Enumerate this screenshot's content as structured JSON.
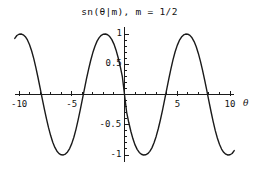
{
  "chart_data": {
    "type": "line",
    "title": "sn(θ|m), m = 1/2",
    "title_parts": {
      "func": "sn(",
      "theta": "θ",
      "bar": "|",
      "m1": "m",
      "close": "),",
      "m2": "m",
      "eq": "=",
      "value": "1/2"
    },
    "xlabel": "θ",
    "ylabel": "",
    "xlim": [
      -10.4,
      10.4
    ],
    "ylim": [
      -1.12,
      1.12
    ],
    "grid": false,
    "legend": null,
    "x_major_ticks": [
      -10,
      -5,
      5,
      10
    ],
    "x_major_tick_labels": [
      "-10",
      "-5",
      "5",
      "10"
    ],
    "x_minor_ticks": [
      -9,
      -8,
      -7,
      -6,
      -4,
      -3,
      -2,
      -1,
      1,
      2,
      3,
      4,
      6,
      7,
      8,
      9
    ],
    "y_major_ticks": [
      -1,
      -0.5,
      0.5,
      1
    ],
    "y_major_tick_labels": [
      "-1",
      "-0.5",
      "0.5",
      "1"
    ],
    "y_minor_ticks": [
      -0.9,
      -0.8,
      -0.7,
      -0.6,
      -0.4,
      -0.3,
      -0.2,
      -0.1,
      0.1,
      0.2,
      0.3,
      0.4,
      0.6,
      0.7,
      0.8,
      0.9
    ],
    "series": [
      {
        "name": "sn(θ|1/2)",
        "color": "#1a1a1a",
        "parameter_m": 0.5,
        "quarter_period_K": 1.8541,
        "period": 7.4163,
        "zeros": [
          -7.4163,
          -3.7081,
          0,
          3.7081,
          7.4163
        ],
        "maxima_x": [
          -9.2704,
          -1.8541,
          5.5622
        ],
        "minima_x": [
          -5.5622,
          1.8541,
          9.2704
        ],
        "x": [
          -10.4,
          -10.2,
          -10,
          -9.8,
          -9.6,
          -9.4,
          -9.2,
          -9,
          -8.8,
          -8.6,
          -8.4,
          -8.2,
          -8,
          -7.8,
          -7.6,
          -7.4,
          -7.2,
          -7,
          -6.8,
          -6.6,
          -6.4,
          -6.2,
          -6,
          -5.8,
          -5.6,
          -5.4,
          -5.2,
          -5,
          -4.8,
          -4.6,
          -4.4,
          -4.2,
          -4,
          -3.8,
          -3.6,
          -3.4,
          -3.2,
          -3,
          -2.8,
          -2.6,
          -2.4,
          -2.2,
          -2,
          -1.8,
          -1.6,
          -1.4,
          -1.2,
          -1,
          -0.8,
          -0.6,
          -0.4,
          -0.2,
          0,
          0.2,
          0.4,
          0.6,
          0.8,
          1,
          1.2,
          1.4,
          1.6,
          1.8,
          2,
          2.2,
          2.4,
          2.6,
          2.8,
          3,
          3.2,
          3.4,
          3.6,
          3.8,
          4,
          4.2,
          4.4,
          4.6,
          4.8,
          5,
          5.2,
          5.4,
          5.6,
          5.8,
          6,
          6.2,
          6.4,
          6.6,
          6.8,
          7,
          7.2,
          7.4,
          7.6,
          7.8,
          8,
          8.2,
          8.4,
          8.6,
          8.8,
          9,
          9.2,
          9.4,
          9.6,
          9.8,
          10,
          10.2,
          10.4
        ],
        "y": [
          0.927,
          0.975,
          0.996,
          1.0,
          0.987,
          0.955,
          0.901,
          0.823,
          0.72,
          0.593,
          0.445,
          0.281,
          0.108,
          -0.067,
          -0.238,
          -0.4,
          -0.548,
          -0.679,
          -0.789,
          -0.875,
          -0.937,
          -0.977,
          -0.997,
          -0.999,
          -0.984,
          -0.95,
          -0.893,
          -0.812,
          -0.706,
          -0.576,
          -0.425,
          -0.259,
          -0.085,
          0.09,
          0.261,
          0.421,
          0.566,
          0.693,
          0.799,
          0.882,
          0.94,
          0.978,
          0.996,
          1.0,
          0.988,
          0.958,
          0.907,
          0.833,
          0.733,
          0.607,
          0.459,
          0.29,
          0.0,
          -0.29,
          -0.459,
          -0.607,
          -0.733,
          -0.833,
          -0.907,
          -0.958,
          -0.988,
          -1.0,
          -0.996,
          -0.978,
          -0.94,
          -0.882,
          -0.799,
          -0.693,
          -0.566,
          -0.421,
          -0.261,
          -0.09,
          0.085,
          0.259,
          0.425,
          0.576,
          0.706,
          0.812,
          0.893,
          0.95,
          0.984,
          0.999,
          0.997,
          0.977,
          0.937,
          0.875,
          0.789,
          0.679,
          0.548,
          0.4,
          0.238,
          0.067,
          -0.108,
          -0.281,
          -0.445,
          -0.593,
          -0.72,
          -0.823,
          -0.901,
          -0.955,
          -0.987,
          -1.0,
          -0.996,
          -0.975,
          -0.927
        ]
      }
    ]
  }
}
